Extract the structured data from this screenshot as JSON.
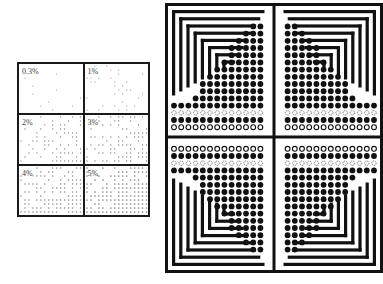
{
  "figure": {
    "left_grid": {
      "cells": [
        {
          "label": "0.3%",
          "density": 0.003
        },
        {
          "label": "1%",
          "density": 0.01
        },
        {
          "label": "2%",
          "density": 0.02
        },
        {
          "label": "3%",
          "density": 0.03
        },
        {
          "label": "4%",
          "density": 0.04
        },
        {
          "label": "5%",
          "density": 0.05
        }
      ]
    },
    "right_diagram": {
      "quadrants": [
        "top-left",
        "top-right",
        "bottom-left",
        "bottom-right"
      ],
      "stripe_count": 10,
      "dot_color": "#111111",
      "stripe_color": "#111111"
    }
  }
}
